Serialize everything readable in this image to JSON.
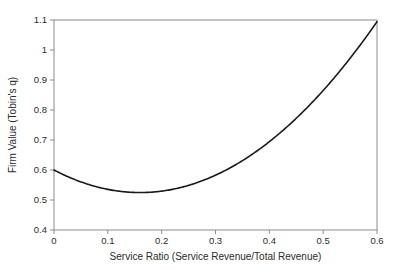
{
  "chart_data": {
    "type": "line",
    "title": "",
    "subtitle": "",
    "xlabel": "Service Ratio (Service Revenue/Total Revenue)",
    "ylabel": "Firm Value (Tobin's q)",
    "xlim": [
      0,
      0.6
    ],
    "ylim": [
      0.4,
      1.1
    ],
    "grid": false,
    "legend": null,
    "legend_position": "none",
    "xticks": [
      0,
      0.1,
      0.2,
      0.3,
      0.4,
      0.5,
      0.6
    ],
    "xtick_labels": [
      "0",
      "0.1",
      "0.2",
      "0.3",
      "0.4",
      "0.5",
      "0.6"
    ],
    "yticks": [
      0.4,
      0.5,
      0.6,
      0.7,
      0.8,
      0.9,
      1.0,
      1.1
    ],
    "ytick_labels": [
      "0.4",
      "0.5",
      "0.6",
      "0.7",
      "0.8",
      "0.9",
      "1",
      "1.1"
    ],
    "series": [
      {
        "name": "Firm Value vs Service Ratio",
        "color": "#1a1a1a",
        "line_width": 1.6,
        "shape": "quadratic-u-curve",
        "fit": {
          "equation": "y = 2.94x^2 - 0.94x + 0.60",
          "a": 2.94,
          "b": -0.94,
          "c": 0.6,
          "vertex_x": 0.16,
          "vertex_y": 0.55
        },
        "x": [
          0.0,
          0.03,
          0.06,
          0.09,
          0.12,
          0.15,
          0.18,
          0.21,
          0.24,
          0.27,
          0.3,
          0.33,
          0.36,
          0.39,
          0.42,
          0.45,
          0.48,
          0.51,
          0.54,
          0.57,
          0.6
        ],
        "values": [
          0.6,
          0.575,
          0.554,
          0.539,
          0.53,
          0.525,
          0.526,
          0.532,
          0.543,
          0.56,
          0.582,
          0.61,
          0.643,
          0.681,
          0.724,
          0.773,
          0.827,
          0.887,
          0.952,
          1.022,
          0.98
        ]
      }
    ],
    "annotations": [],
    "axis_color": "#8c8c8c",
    "text_color": "#2b2b2b",
    "background": "#ffffff"
  }
}
